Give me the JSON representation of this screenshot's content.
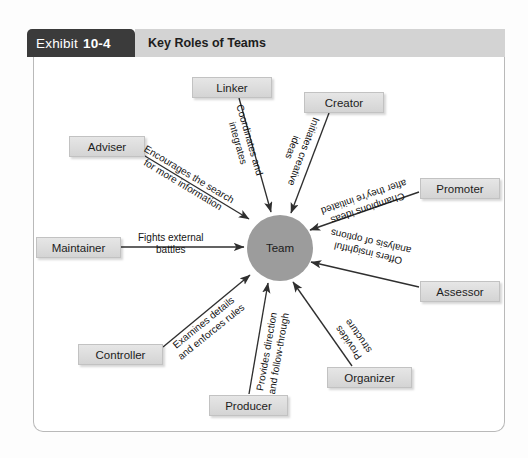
{
  "header": {
    "exhibit_word": "Exhibit",
    "exhibit_number": "10-4",
    "title": "Key Roles of Teams"
  },
  "diagram": {
    "type": "radial-hub-and-spoke",
    "center": {
      "label": "Team",
      "shape": "circle",
      "fill": "#9c9c9c"
    },
    "box_fill": "#dcdcdc",
    "arrow_color": "#2f2f2f",
    "nodes": [
      {
        "id": "linker",
        "label": "Linker",
        "edge_label": "Coordinates and\nintegrates"
      },
      {
        "id": "creator",
        "label": "Creator",
        "edge_label": "Initiates creative\nideas"
      },
      {
        "id": "promoter",
        "label": "Promoter",
        "edge_label": "Champions ideas\nafter they're initiated"
      },
      {
        "id": "assessor",
        "label": "Assessor",
        "edge_label": "Offers insightful\nanalysis of options"
      },
      {
        "id": "organizer",
        "label": "Organizer",
        "edge_label": "Provides\nstructure"
      },
      {
        "id": "producer",
        "label": "Producer",
        "edge_label": "Provides direction\nand follow-through"
      },
      {
        "id": "controller",
        "label": "Controller",
        "edge_label": "Examines details\nand enforces rules"
      },
      {
        "id": "maintainer",
        "label": "Maintainer",
        "edge_label": "Fights external\nbattles"
      },
      {
        "id": "adviser",
        "label": "Adviser",
        "edge_label": "Encourages the search\nfor more information"
      }
    ]
  }
}
